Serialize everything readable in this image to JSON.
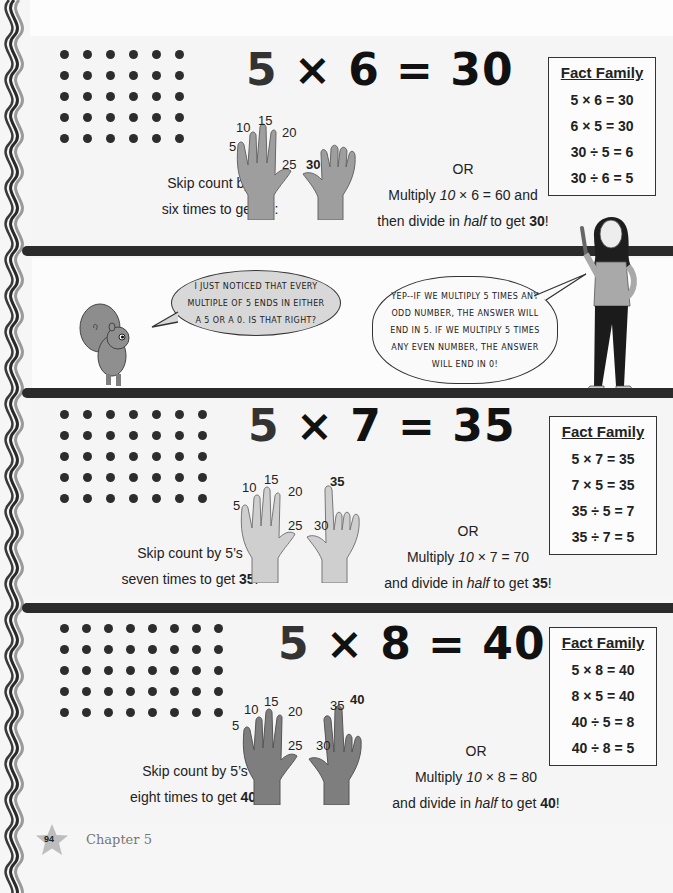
{
  "page": {
    "number": "94",
    "chapter": "Chapter 5"
  },
  "colors": {
    "bar": "#2b2b2b",
    "dot": "#2d2d2d",
    "hand_light": "#c8c8c8",
    "hand_dark": "#8a8a8a",
    "bubble_fill": "#d8d8d8"
  },
  "sections": [
    {
      "equation": {
        "a": "5",
        "op": "×",
        "b": "6",
        "eq": "=",
        "result": "30"
      },
      "dots": {
        "rows": 5,
        "cols": 6
      },
      "skip_line1": "Skip count by 5’s",
      "skip_line2_pre": "six times to get ",
      "skip_line2_bold": "30",
      "skip_line2_post": ":",
      "hand_labels": [
        "5",
        "10",
        "15",
        "20",
        "25",
        "30"
      ],
      "or_label": "OR",
      "multiply_pre": "Multiply ",
      "multiply_italic": "10",
      "multiply_post": " × 6 = 60 and",
      "divide_pre": "then divide in ",
      "divide_italic": "half",
      "divide_mid": " to get ",
      "divide_bold": "30",
      "divide_post": "!",
      "fact_family": {
        "title": "Fact Family",
        "rows": [
          "5 × 6 = 30",
          "6 × 5 = 30",
          "30 ÷ 5 = 6",
          "30 ÷ 6 = 5"
        ]
      }
    },
    {
      "equation": {
        "a": "5",
        "op": "×",
        "b": "7",
        "eq": "=",
        "result": "35"
      },
      "dots": {
        "rows": 5,
        "cols": 7
      },
      "skip_line1": "Skip count by 5’s",
      "skip_line2_pre": "seven times to get ",
      "skip_line2_bold": "35",
      "skip_line2_post": ":",
      "hand_labels": [
        "5",
        "10",
        "15",
        "20",
        "25",
        "30",
        "35"
      ],
      "or_label": "OR",
      "multiply_pre": "Multiply ",
      "multiply_italic": "10",
      "multiply_post": " × 7 = 70",
      "divide_pre": "and divide in ",
      "divide_italic": "half",
      "divide_mid": " to get ",
      "divide_bold": "35",
      "divide_post": "!",
      "fact_family": {
        "title": "Fact Family",
        "rows": [
          "5 × 7 = 35",
          "7 × 5 = 35",
          "35 ÷ 5 = 7",
          "35 ÷ 7 = 5"
        ]
      }
    },
    {
      "equation": {
        "a": "5",
        "op": "×",
        "b": "8",
        "eq": "=",
        "result": "40"
      },
      "dots": {
        "rows": 5,
        "cols": 8
      },
      "skip_line1": "Skip count by 5’s",
      "skip_line2_pre": "eight times to get ",
      "skip_line2_bold": "40",
      "skip_line2_post": ":",
      "hand_labels": [
        "5",
        "10",
        "15",
        "20",
        "25",
        "30",
        "35",
        "40"
      ],
      "or_label": "OR",
      "multiply_pre": "Multiply ",
      "multiply_italic": "10",
      "multiply_post": " × 8 = 80",
      "divide_pre": "and divide in ",
      "divide_italic": "half",
      "divide_mid": " to get ",
      "divide_bold": "40",
      "divide_post": "!",
      "fact_family": {
        "title": "Fact Family",
        "rows": [
          "5 × 8 = 40",
          "8 × 5 = 40",
          "40 ÷ 5 = 8",
          "40 ÷ 8 = 5"
        ]
      }
    }
  ],
  "comic": {
    "squirrel_speech": [
      "I JUST NOTICED THAT EVERY",
      "MULTIPLE OF 5 ENDS IN EITHER",
      "A 5 OR A 0. IS THAT RIGHT?"
    ],
    "girl_speech": [
      "YEP--IF WE MULTIPLY 5 TIMES ANY",
      "ODD NUMBER, THE ANSWER WILL",
      "END IN 5. IF WE MULTIPLY 5 TIMES",
      "ANY EVEN NUMBER, THE ANSWER",
      "WILL END IN 0!"
    ]
  }
}
